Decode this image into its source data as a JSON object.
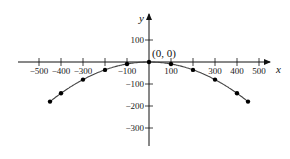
{
  "chart_data": {
    "type": "scatter",
    "title": "",
    "xlabel": "x",
    "ylabel": "y",
    "xlim": [
      -520,
      560
    ],
    "ylim": [
      -380,
      190
    ],
    "x_ticks": [
      -500,
      -400,
      -300,
      -200,
      -100,
      100,
      200,
      300,
      400,
      500
    ],
    "x_tick_labels": [
      "-500",
      "-400",
      "-300",
      "",
      "-100",
      "100",
      "",
      "300",
      "400",
      "500"
    ],
    "y_ticks": [
      100,
      -100,
      -200,
      -300
    ],
    "y_tick_labels": [
      "100",
      "-100",
      "-200",
      "-300"
    ],
    "annotations": [
      {
        "text": "(0, 0)",
        "x": 0,
        "y": 0
      }
    ],
    "series": [
      {
        "name": "parabola",
        "connected": true,
        "x": [
          -450,
          -400,
          -300,
          -200,
          -100,
          0,
          100,
          200,
          300,
          400,
          450
        ],
        "y": [
          -180,
          -142,
          -80,
          -36,
          -9,
          0,
          -9,
          -36,
          -80,
          -142,
          -180
        ]
      }
    ],
    "grid": false,
    "legend": null
  },
  "colors": {
    "axis": "#111111",
    "curve": "#444444",
    "points": "#000000"
  }
}
